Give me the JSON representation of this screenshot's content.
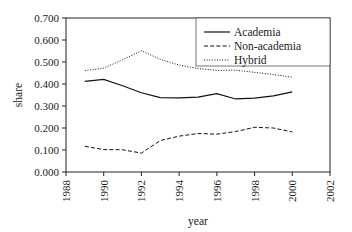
{
  "chart_data": {
    "type": "line",
    "title": "",
    "subtitle": "",
    "xlabel": "year",
    "ylabel": "share",
    "xlim": [
      1988,
      2002
    ],
    "ylim": [
      0.0,
      0.7
    ],
    "grid": false,
    "legend_position": "top-right",
    "x_ticks": [
      "1988",
      "1990",
      "1992",
      "1994",
      "1996",
      "1998",
      "2000",
      "2002"
    ],
    "x_tick_values": [
      1988,
      1990,
      1992,
      1994,
      1996,
      1998,
      2000,
      2002
    ],
    "y_ticks": [
      "0.000",
      "0.100",
      "0.200",
      "0.300",
      "0.400",
      "0.500",
      "0.600",
      "0.700"
    ],
    "y_tick_values": [
      0.0,
      0.1,
      0.2,
      0.3,
      0.4,
      0.5,
      0.6,
      0.7
    ],
    "x": [
      1989,
      1990,
      1991,
      1992,
      1993,
      1994,
      1995,
      1996,
      1997,
      1998,
      1999,
      2000
    ],
    "series": [
      {
        "name": "Academia",
        "style": "solid",
        "color": "#111111",
        "values": [
          0.412,
          0.421,
          0.392,
          0.36,
          0.338,
          0.337,
          0.34,
          0.356,
          0.332,
          0.336,
          0.346,
          0.364
        ]
      },
      {
        "name": "Non-academia",
        "style": "dashed",
        "color": "#111111",
        "values": [
          0.117,
          0.102,
          0.101,
          0.086,
          0.143,
          0.163,
          0.175,
          0.172,
          0.184,
          0.203,
          0.2,
          0.182
        ]
      },
      {
        "name": "Hybrid",
        "style": "dotted",
        "color": "#111111",
        "values": [
          0.461,
          0.472,
          0.51,
          0.551,
          0.512,
          0.486,
          0.47,
          0.462,
          0.463,
          0.453,
          0.443,
          0.431
        ]
      }
    ]
  },
  "axis": {
    "ylabel": "share",
    "xlabel": "year"
  },
  "legend": {
    "items": [
      {
        "label": "Academia"
      },
      {
        "label": "Non-academia"
      },
      {
        "label": "Hybrid"
      }
    ]
  }
}
